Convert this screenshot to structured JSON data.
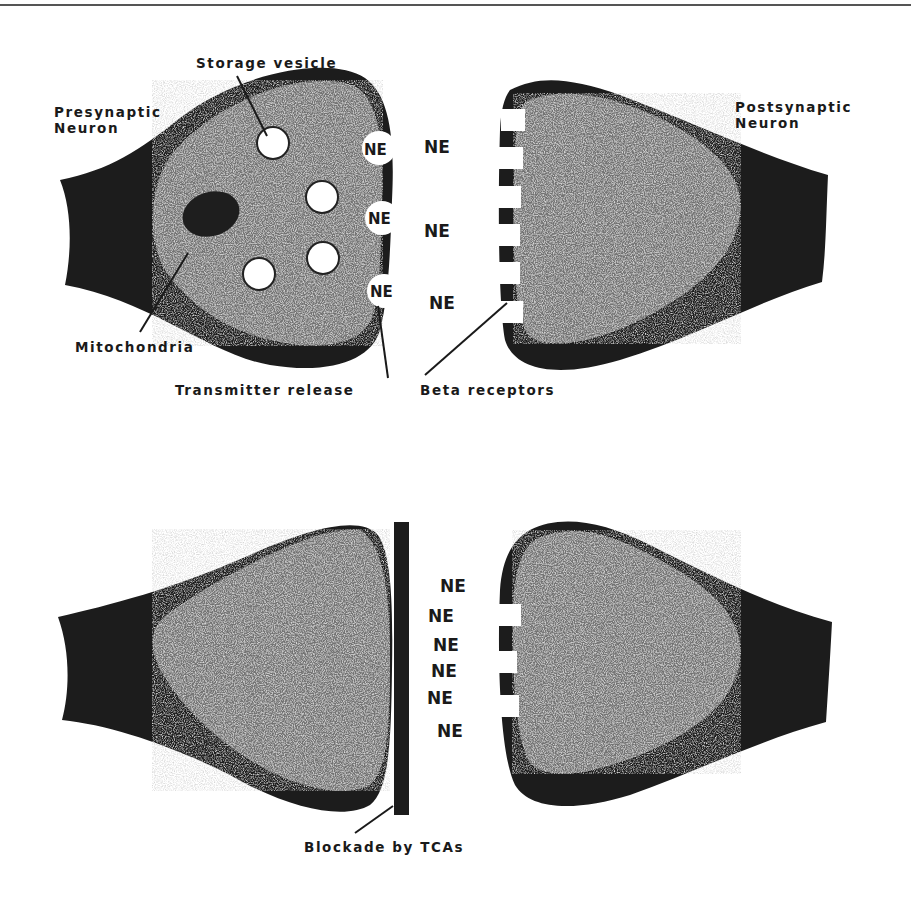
{
  "figure": {
    "colors": {
      "sheath": "#1c1c1c",
      "cytoplasm": "#6e6e6e",
      "vesicle": "#ffffff",
      "text": "#1a1a1a",
      "background": "#ffffff"
    },
    "top_panel": {
      "presynaptic_label_line1": "Presynaptic",
      "presynaptic_label_line2": "Neuron",
      "postsynaptic_label_line1": "Postsynaptic",
      "postsynaptic_label_line2": "Neuron",
      "storage_vesicle_label": "Storage vesicle",
      "mitochondria_label": "Mitochondria",
      "transmitter_release_label": "Transmitter release",
      "beta_receptors_label": "Beta receptors",
      "released_vesicle_labels": [
        "NE",
        "NE",
        "NE"
      ],
      "cleft_ne_labels": [
        "NE",
        "NE",
        "NE"
      ],
      "storage_vesicle_count": 4,
      "beta_receptor_count": 6
    },
    "bottom_panel": {
      "blockade_label": "Blockade by TCAs",
      "cleft_ne_labels": [
        "NE",
        "NE",
        "NE",
        "NE",
        "NE",
        "NE"
      ],
      "beta_receptor_count": 3
    }
  }
}
